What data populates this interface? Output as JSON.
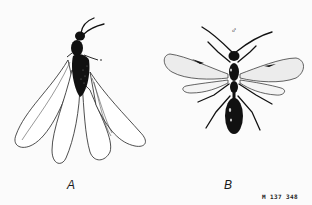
{
  "figure": {
    "panels": [
      {
        "id": "A",
        "label": "A",
        "subject": "winged insect with four elongated, overlapping wings (dark body, wings folded down)"
      },
      {
        "id": "B",
        "label": "B",
        "subject": "winged wasp-like insect, wings spread, long legs and antennae",
        "sex_symbol": "♂"
      }
    ],
    "code": "M 137 348",
    "colors": {
      "ink": "#111111",
      "background": "#fbfbfb",
      "wing_stipple": "#d8d8d8"
    }
  }
}
